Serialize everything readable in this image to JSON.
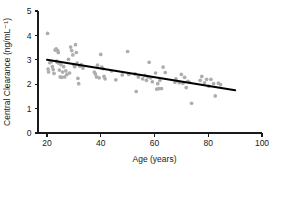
{
  "chart_data": {
    "type": "scatter",
    "title": "",
    "xlabel": "Age (years)",
    "ylabel": "Central Clearance (ng/mL⁻¹)",
    "xlim": [
      15,
      100
    ],
    "ylim": [
      0,
      5
    ],
    "xticks": [
      20,
      40,
      60,
      80,
      100
    ],
    "yticks": [
      0,
      1,
      2,
      3,
      4,
      5
    ],
    "xtick_labels": [
      "20",
      "40",
      "60",
      "80",
      "100"
    ],
    "ytick_labels": [
      "0",
      "1",
      "2",
      "3",
      "4",
      "5"
    ],
    "grid": false,
    "legend": null,
    "marker_color": "#adadad",
    "line_color": "#000000",
    "axis_color": "#1a1a1a",
    "series": [
      {
        "name": "Observations",
        "type": "scatter",
        "points": [
          [
            20.2,
            4.08
          ],
          [
            20.4,
            2.62
          ],
          [
            20.6,
            2.5
          ],
          [
            21.0,
            2.88
          ],
          [
            21.6,
            2.92
          ],
          [
            22.0,
            2.72
          ],
          [
            22.3,
            2.6
          ],
          [
            22.6,
            2.44
          ],
          [
            23.0,
            3.4
          ],
          [
            23.4,
            3.45
          ],
          [
            23.6,
            2.95
          ],
          [
            23.8,
            2.9
          ],
          [
            24.0,
            3.38
          ],
          [
            24.2,
            3.3
          ],
          [
            24.4,
            2.86
          ],
          [
            24.6,
            2.58
          ],
          [
            24.9,
            2.3
          ],
          [
            25.2,
            2.8
          ],
          [
            25.5,
            2.28
          ],
          [
            25.8,
            2.5
          ],
          [
            26.2,
            2.72
          ],
          [
            26.6,
            2.3
          ],
          [
            27.0,
            2.55
          ],
          [
            27.4,
            2.4
          ],
          [
            28.0,
            3.02
          ],
          [
            28.4,
            2.46
          ],
          [
            28.8,
            3.52
          ],
          [
            29.2,
            3.38
          ],
          [
            29.6,
            3.2
          ],
          [
            30.0,
            2.8
          ],
          [
            30.3,
            2.72
          ],
          [
            30.6,
            3.62
          ],
          [
            30.9,
            3.3
          ],
          [
            31.2,
            2.86
          ],
          [
            31.5,
            2.24
          ],
          [
            31.8,
            2.02
          ],
          [
            32.2,
            2.74
          ],
          [
            32.8,
            2.8
          ],
          [
            33.4,
            2.66
          ],
          [
            37.6,
            2.5
          ],
          [
            38.0,
            2.42
          ],
          [
            38.4,
            2.3
          ],
          [
            38.8,
            2.78
          ],
          [
            39.4,
            2.26
          ],
          [
            40.0,
            3.22
          ],
          [
            40.4,
            2.7
          ],
          [
            40.8,
            2.64
          ],
          [
            41.2,
            2.32
          ],
          [
            41.6,
            2.22
          ],
          [
            44.0,
            2.54
          ],
          [
            45.6,
            2.18
          ],
          [
            48.0,
            2.38
          ],
          [
            50.0,
            3.34
          ],
          [
            50.4,
            2.4
          ],
          [
            52.8,
            2.42
          ],
          [
            53.2,
            1.7
          ],
          [
            54.0,
            2.3
          ],
          [
            55.6,
            2.22
          ],
          [
            56.4,
            2.36
          ],
          [
            57.0,
            2.16
          ],
          [
            57.6,
            2.3
          ],
          [
            58.0,
            2.9
          ],
          [
            58.6,
            2.26
          ],
          [
            59.2,
            2.1
          ],
          [
            60.4,
            2.46
          ],
          [
            60.8,
            1.8
          ],
          [
            61.2,
            2.02
          ],
          [
            61.6,
            1.82
          ],
          [
            62.0,
            2.16
          ],
          [
            62.6,
            1.82
          ],
          [
            63.2,
            2.7
          ],
          [
            64.0,
            2.48
          ],
          [
            67.6,
            2.08
          ],
          [
            68.0,
            2.22
          ],
          [
            69.2,
            2.06
          ],
          [
            70.0,
            2.4
          ],
          [
            70.6,
            2.04
          ],
          [
            71.2,
            2.28
          ],
          [
            71.8,
            1.86
          ],
          [
            72.4,
            2.12
          ],
          [
            73.0,
            2.08
          ],
          [
            73.8,
            1.22
          ],
          [
            77.0,
            2.16
          ],
          [
            77.6,
            2.32
          ],
          [
            78.6,
            2.06
          ],
          [
            79.4,
            2.2
          ],
          [
            80.2,
            1.92
          ],
          [
            81.0,
            2.2
          ],
          [
            82.0,
            2.02
          ],
          [
            82.6,
            1.52
          ],
          [
            83.8,
            2.04
          ],
          [
            84.6,
            1.98
          ]
        ]
      },
      {
        "name": "Linear regression fit",
        "type": "line",
        "points": [
          [
            20,
            3.0
          ],
          [
            90,
            1.75
          ]
        ]
      }
    ]
  }
}
